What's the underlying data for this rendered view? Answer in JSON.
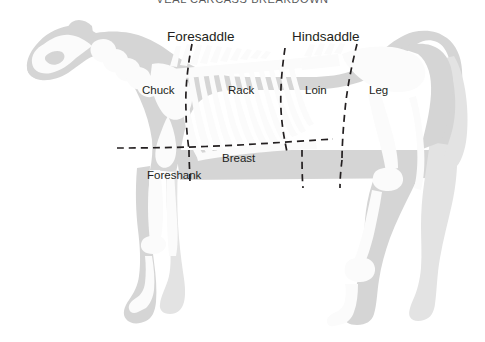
{
  "title": "VEAL CARCASS BREAKDOWN",
  "colors": {
    "background": "#ffffff",
    "body_fill": "#d5d5d5",
    "body_fill_light": "#e3e3e3",
    "bone_fill": "#fbfbfb",
    "cut_line": "#231f20",
    "label_text": "#231f20",
    "title_text": "#58595b"
  },
  "primal_groups": [
    {
      "id": "foresaddle",
      "label": "Foresaddle"
    },
    {
      "id": "hindsaddle",
      "label": "Hindsaddle"
    }
  ],
  "cuts": [
    {
      "id": "chuck",
      "label": "Chuck"
    },
    {
      "id": "rack",
      "label": "Rack"
    },
    {
      "id": "loin",
      "label": "Loin"
    },
    {
      "id": "leg",
      "label": "Leg"
    },
    {
      "id": "breast",
      "label": "Breast"
    },
    {
      "id": "foreshank",
      "label": "Foreshank"
    }
  ],
  "diagram": {
    "orientation": "facing-left",
    "line_style": "dashed"
  }
}
